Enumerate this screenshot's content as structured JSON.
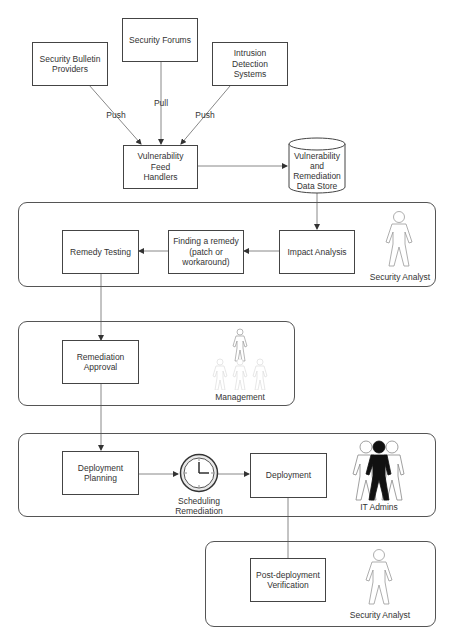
{
  "diagram": {
    "sources": [
      {
        "id": "bulletin",
        "label": "Security Bulletin\nProviders"
      },
      {
        "id": "forums",
        "label": "Security Forums"
      },
      {
        "id": "ids",
        "label": "Intrusion\nDetection\nSystems"
      }
    ],
    "edge_labels": {
      "bulletin_to_handlers": "Push",
      "forums_to_handlers": "Pull",
      "ids_to_handlers": "Push"
    },
    "feed_handlers": {
      "label": "Vulnerability\nFeed\nHandlers"
    },
    "data_store": {
      "label": "Vulnerability\nand\nRemediation\nData Store"
    },
    "lanes": [
      {
        "id": "analysis",
        "actor": "Security Analyst",
        "actor_icon": "person-outline-icon",
        "steps": [
          {
            "id": "impact",
            "label": "Impact Analysis"
          },
          {
            "id": "finding",
            "label": "Finding a remedy\n(patch or\nworkaround)"
          },
          {
            "id": "testing",
            "label": "Remedy Testing"
          }
        ]
      },
      {
        "id": "approval",
        "actor": "Management",
        "actor_icon": "org-hierarchy-people-icon",
        "steps": [
          {
            "id": "approval",
            "label": "Remediation\nApproval"
          }
        ]
      },
      {
        "id": "deployment",
        "actor": "IT Admins",
        "actor_icon": "group-people-icon",
        "steps": [
          {
            "id": "planning",
            "label": "Deployment\nPlanning"
          },
          {
            "id": "scheduling",
            "label": "Scheduling\nRemediation",
            "icon": "clock-icon"
          },
          {
            "id": "deploy",
            "label": "Deployment"
          }
        ]
      },
      {
        "id": "verification",
        "actor": "Security Analyst",
        "actor_icon": "person-outline-icon",
        "steps": [
          {
            "id": "verify",
            "label": "Post-deployment\nVerification"
          }
        ]
      }
    ],
    "colors": {
      "line": "#555555",
      "box_border": "#444444",
      "text": "#333333",
      "faded_figure": "#cccccc",
      "admin_figure": "#111111"
    }
  }
}
